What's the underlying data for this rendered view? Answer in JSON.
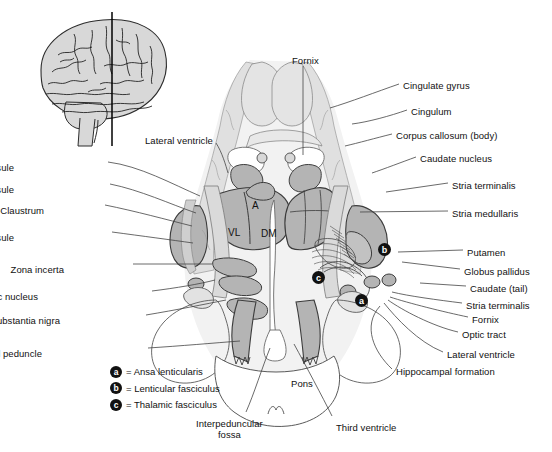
{
  "figure": {
    "background": "#ffffff",
    "colors": {
      "brain_inset_fill": "#d8d8d8",
      "gray_matter_fill": "#b4b4b4",
      "light_gray_fill": "#d5d5d5",
      "pale_fill": "#e8e8e8",
      "outline": "#3a3a3a",
      "leader_line": "#444444",
      "marker_fill": "#141414",
      "marker_text": "#ffffff",
      "text": "#111111"
    }
  },
  "inset": {
    "name": "lateral-brain-view",
    "section_line_label": ""
  },
  "labels_left": [
    {
      "text": "Internal capsule",
      "x": 14,
      "y": 162,
      "anchor": "right",
      "lead_to_x": 200,
      "lead_to_y": 196
    },
    {
      "text": "External capsule",
      "x": 14,
      "y": 184,
      "anchor": "right",
      "lead_to_x": 196,
      "lead_to_y": 213
    },
    {
      "text": "Claustrum",
      "x": 44,
      "y": 205,
      "anchor": "right",
      "lead_to_x": 192,
      "lead_to_y": 226
    },
    {
      "text": "Extreme capsule",
      "x": 14,
      "y": 232,
      "anchor": "right",
      "lead_to_x": 193,
      "lead_to_y": 243
    },
    {
      "text": "Zona incerta",
      "x": 64,
      "y": 264,
      "anchor": "right",
      "lead_to_x": 212,
      "lead_to_y": 264
    },
    {
      "text": "Subthalamic nucleus",
      "x": 38,
      "y": 291,
      "anchor": "right",
      "lead_to_x": 215,
      "lead_to_y": 280
    },
    {
      "text": "Substantia nigra",
      "x": 60,
      "y": 315,
      "anchor": "right",
      "lead_to_x": 226,
      "lead_to_y": 300
    },
    {
      "text": "Cerebral peduncle",
      "x": 42,
      "y": 348,
      "anchor": "right",
      "lead_to_x": 240,
      "lead_to_y": 341
    }
  ],
  "labels_right": [
    {
      "text": "Cingulate gyrus",
      "x": 403,
      "y": 80,
      "lead_to_x": 330,
      "lead_to_y": 108
    },
    {
      "text": "Cingulum",
      "x": 411,
      "y": 106,
      "lead_to_x": 352,
      "lead_to_y": 124
    },
    {
      "text": "Corpus callosum (body)",
      "x": 396,
      "y": 130,
      "lead_to_x": 345,
      "lead_to_y": 146
    },
    {
      "text": "Caudate nucleus",
      "x": 420,
      "y": 153,
      "lead_to_x": 372,
      "lead_to_y": 173
    },
    {
      "text": "Stria terminalis",
      "x": 452,
      "y": 180,
      "lead_to_x": 386,
      "lead_to_y": 192
    },
    {
      "text": "Stria medullaris",
      "x": 452,
      "y": 208,
      "lead_to_x": 360,
      "lead_to_y": 212
    },
    {
      "text": "Putamen",
      "x": 467,
      "y": 247,
      "lead_to_x": 398,
      "lead_to_y": 252
    },
    {
      "text": "Globus pallidus",
      "x": 464,
      "y": 266,
      "lead_to_x": 402,
      "lead_to_y": 262
    },
    {
      "text": "Caudate (tail)",
      "x": 470,
      "y": 283,
      "lead_to_x": 420,
      "lead_to_y": 283
    },
    {
      "text": "Stria terminalis",
      "x": 466,
      "y": 300,
      "lead_to_x": 392,
      "lead_to_y": 292
    },
    {
      "text": "Fornix",
      "x": 472,
      "y": 314,
      "lead_to_x": 390,
      "lead_to_y": 297
    },
    {
      "text": "Optic tract",
      "x": 462,
      "y": 329,
      "lead_to_x": 388,
      "lead_to_y": 300
    },
    {
      "text": "Lateral ventricle",
      "x": 447,
      "y": 349,
      "lead_to_x": 384,
      "lead_to_y": 303
    },
    {
      "text": "Hippocampal formation",
      "x": 396,
      "y": 366,
      "lead_to_x": 380,
      "lead_to_y": 306
    }
  ],
  "labels_top": [
    {
      "text": "Fornix",
      "x": 292,
      "y": 55,
      "lead_to_x": 303,
      "lead_to_y": 155
    },
    {
      "text": "Lateral ventricle",
      "x": 145,
      "y": 135,
      "lead_to_x": 228,
      "lead_to_y": 173
    }
  ],
  "labels_bottom": [
    {
      "text": "Pons",
      "x": 291,
      "y": 378,
      "lead_to_x": null,
      "lead_to_y": null
    },
    {
      "text": "Third ventricle",
      "x": 336,
      "y": 422,
      "lead_to_x": 294,
      "lead_to_y": 344
    }
  ],
  "labels_bottom_multiline": [
    {
      "line1": "Interpeduncular",
      "line2": "fossa",
      "x": 196,
      "y": 418,
      "lead_to_x": 270,
      "lead_to_y": 348
    }
  ],
  "inner_labels": [
    {
      "text": "A",
      "x": 252,
      "y": 200
    },
    {
      "text": "VL",
      "x": 228,
      "y": 227
    },
    {
      "text": "DM",
      "x": 261,
      "y": 228
    }
  ],
  "markers": [
    {
      "key": "a",
      "x": 355,
      "y": 294
    },
    {
      "key": "b",
      "x": 378,
      "y": 243
    },
    {
      "key": "c",
      "x": 312,
      "y": 271
    }
  ],
  "legend": [
    {
      "key": "a",
      "equals": "=",
      "text": "Ansa lenticularis"
    },
    {
      "key": "b",
      "equals": "=",
      "text": "Lenticular fasciculus"
    },
    {
      "key": "c",
      "equals": "=",
      "text": "Thalamic fasciculus"
    }
  ]
}
